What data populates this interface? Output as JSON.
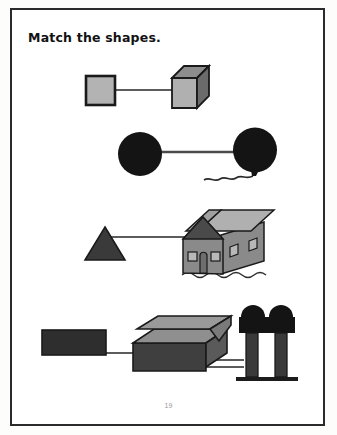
{
  "page": {
    "title": "Match the shapes.",
    "page_number": "19",
    "background_color": "#ffffff",
    "border_color": "#2b2b2b"
  },
  "palette": {
    "outline": "#1a1a1a",
    "connector": "#5c5c5c",
    "light_gray": "#b3b3b3",
    "mid_gray": "#9a9a9a",
    "dark_gray": "#6e6e6e",
    "darker_gray": "#585858",
    "near_black": "#1c1c1c",
    "black": "#111111",
    "roof_light": "#b0b0b0",
    "wall_gray": "#8a8a8a",
    "gable_dark": "#4a4a4a"
  },
  "rows": [
    {
      "id": "row-square-cube",
      "shape_2d": {
        "name": "square",
        "label": "square",
        "fill": "#b3b3b3",
        "stroke": "#1a1a1a"
      },
      "object_3d": {
        "name": "cube",
        "label": "cube",
        "front_fill": "#b0b0b0",
        "top_fill": "#8d8d8d",
        "side_fill": "#6b6b6b",
        "stroke": "#1a1a1a"
      },
      "connector": {
        "name": "match-line",
        "color": "#5c5c5c"
      }
    },
    {
      "id": "row-circle-balloon",
      "shape_2d": {
        "name": "circle",
        "label": "circle",
        "fill": "#141414",
        "stroke": "#141414"
      },
      "object_3d": {
        "name": "balloon",
        "label": "balloon",
        "fill": "#141414",
        "stroke": "#141414",
        "string": "wavy-string"
      },
      "connector": {
        "name": "match-line",
        "color": "#4a4a4a"
      }
    },
    {
      "id": "row-triangle-house",
      "shape_2d": {
        "name": "triangle",
        "label": "triangle",
        "fill": "#3a3a3a",
        "stroke": "#1a1a1a"
      },
      "object_3d": {
        "name": "house",
        "label": "house",
        "roof_fill": "#b0b0b0",
        "gable_fill": "#4a4a4a",
        "wall_fill": "#8a8a8a",
        "window_fill": "#b8b8b8",
        "door_fill": "#6e6e6e",
        "stroke": "#1a1a1a"
      },
      "connector": {
        "name": "match-line",
        "color": "#5c5c5c"
      }
    },
    {
      "id": "row-rectangle-box-trees",
      "shape_2d": {
        "name": "rectangle",
        "label": "rectangle",
        "fill": "#2e2e2e",
        "stroke": "#1a1a1a"
      },
      "object_3d": {
        "name": "open-box",
        "label": "box",
        "front_fill": "#3f3f3f",
        "top_fill": "#8f8f8f",
        "lid_fill": "#9a9a9a",
        "side_fill": "#5a5a5a",
        "stroke": "#1a1a1a"
      },
      "object_extra": {
        "name": "trees",
        "label": "trees",
        "foliage_fill": "#141414",
        "trunk_fill": "#3a3a3a",
        "ground_fill": "#1c1c1c"
      },
      "connector": {
        "name": "match-line",
        "color": "#5c5c5c"
      }
    }
  ]
}
